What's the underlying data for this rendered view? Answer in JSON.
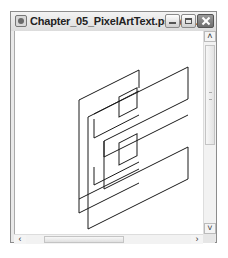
{
  "window": {
    "title": "Chapter_05_PixelArtText.psd @ ...",
    "controls": {
      "minimize": "minimize",
      "maximize": "maximize",
      "close": "close"
    }
  },
  "canvas": {
    "content": "Wireframe 3D letter E outline artwork",
    "stroke_color": "#1a1a1a",
    "background": "#ffffff"
  },
  "scrollbars": {
    "vertical": {
      "up_glyph": "˄",
      "down_glyph": "˅"
    },
    "horizontal": {
      "left_glyph": "‹",
      "right_glyph": "›"
    }
  }
}
